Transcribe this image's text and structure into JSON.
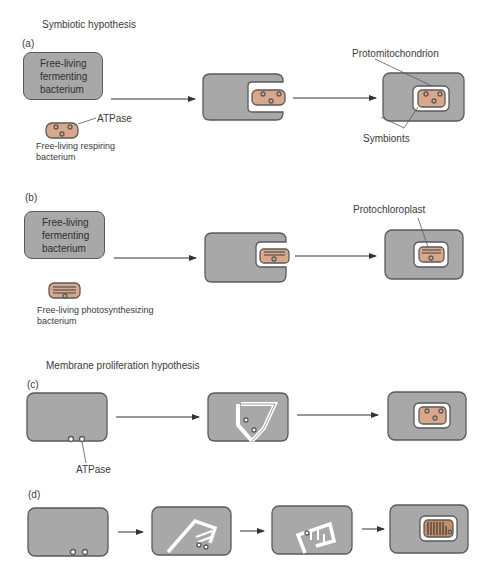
{
  "headings": {
    "symbiotic": "Symbiotic hypothesis",
    "membrane": "Membrane proliferation hypothesis"
  },
  "panels": {
    "a": {
      "label": "(a)",
      "host_text": [
        "Free-living",
        "fermenting",
        "bacterium"
      ],
      "symbiont_caption": [
        "Free-living respiring",
        "bacterium"
      ],
      "atpase_label": "ATPase",
      "protomitochondrion_label": "Protomitochondrion",
      "symbionts_label": "Symbionts"
    },
    "b": {
      "label": "(b)",
      "host_text": [
        "Free-living",
        "fermenting",
        "bacterium"
      ],
      "symbiont_caption": [
        "Free-living photosynthesizing",
        "bacterium"
      ],
      "protochloroplast_label": "Protochloroplast"
    },
    "c": {
      "label": "(c)",
      "atpase_label": "ATPase"
    },
    "d": {
      "label": "(d)"
    }
  },
  "colors": {
    "cell_fill": "#a8a8a8",
    "cell_stroke": "#5a5a5a",
    "symbiont_fill": "#d9a88a",
    "membrane_fill": "#ffffff"
  }
}
